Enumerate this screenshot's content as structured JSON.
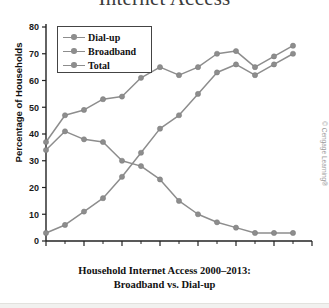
{
  "figure": {
    "title": "Internet Access",
    "caption_line1": "Household Internet Access 2000–2013:",
    "caption_line2": "Broadband vs. Dial-up",
    "watermark": "© Cengage Learning®"
  },
  "legend": {
    "items": [
      {
        "label": "Dial-up"
      },
      {
        "label": "Broadband"
      },
      {
        "label": "Total"
      }
    ]
  },
  "chart_data": {
    "type": "line",
    "title": "Internet Access",
    "xlabel": "",
    "ylabel": "Percentage of Households",
    "xlim": [
      2000,
      2014
    ],
    "ylim": [
      0,
      80
    ],
    "grid": false,
    "legend_position": "top-left",
    "x": [
      2000,
      2001,
      2002,
      2003,
      2004,
      2005,
      2006,
      2007,
      2008,
      2009,
      2010,
      2011,
      2012,
      2013
    ],
    "xticks": [
      2000,
      2002,
      2004,
      2006,
      2008,
      2010,
      2012,
      2014
    ],
    "xtick_labels": [
      "2000",
      "2002",
      "2004",
      "2006",
      "2008",
      "2010",
      "2012",
      "2014"
    ],
    "yticks": [
      0,
      10,
      20,
      30,
      40,
      50,
      60,
      70,
      80
    ],
    "ytick_labels": [
      "0",
      "10",
      "20",
      "30",
      "40",
      "50",
      "60",
      "70",
      "80"
    ],
    "series": [
      {
        "name": "Dial-up",
        "color": "#8d8d8d",
        "values": [
          34,
          41,
          38,
          37,
          30,
          28,
          23,
          15,
          10,
          7,
          5,
          3,
          3,
          3
        ]
      },
      {
        "name": "Broadband",
        "color": "#8d8d8d",
        "values": [
          3,
          6,
          11,
          16,
          24,
          33,
          42,
          47,
          55,
          63,
          66,
          62,
          66,
          70
        ]
      },
      {
        "name": "Total",
        "color": "#8d8d8d",
        "values": [
          37,
          47,
          49,
          53,
          54,
          61,
          65,
          62,
          65,
          70,
          71,
          65,
          69,
          73
        ]
      }
    ]
  }
}
